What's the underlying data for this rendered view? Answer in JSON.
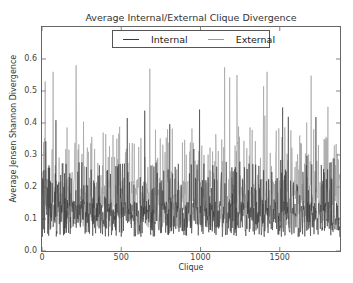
{
  "chart_data": {
    "type": "line",
    "title": "Average Internal/External Clique Divergence",
    "xlabel": "Clique",
    "ylabel": "Average Jensen Shannon Divergence",
    "xlim": [
      0,
      1880
    ],
    "ylim": [
      0.0,
      0.7
    ],
    "xticks": [
      0,
      500,
      1000,
      1500
    ],
    "xtick_labels": [
      "0",
      "500",
      "1000",
      "1500"
    ],
    "yticks": [
      0.0,
      0.1,
      0.2,
      0.3,
      0.4,
      0.5,
      0.6
    ],
    "ytick_labels": [
      "0.0",
      "0.1",
      "0.2",
      "0.3",
      "0.4",
      "0.5",
      "0.6"
    ],
    "grid": false,
    "legend_position": "upper center",
    "n_points_approx": 1880,
    "data_note": "Approximately 1880 points per series cannot be read individually at this resolution. Values below are summary estimates read off the axes; the rendered lines are synthetic, generated from these estimates, and are NOT the actual data.",
    "series": [
      {
        "name": "Internal",
        "color": "#3a3a3a",
        "typical_min": 0.03,
        "typical_center": 0.1,
        "typical_upper_band": 0.25,
        "peak_max": 0.45
      },
      {
        "name": "External",
        "color": "#9a9a9a",
        "typical_min": 0.05,
        "typical_center": 0.15,
        "typical_upper_band": 0.35,
        "peak_max": 0.58,
        "notable_peaks": [
          {
            "x": 20,
            "y": 0.53
          },
          {
            "x": 70,
            "y": 0.56
          },
          {
            "x": 215,
            "y": 0.58
          },
          {
            "x": 680,
            "y": 0.57
          },
          {
            "x": 1230,
            "y": 0.55
          },
          {
            "x": 1420,
            "y": 0.56
          }
        ]
      }
    ]
  }
}
